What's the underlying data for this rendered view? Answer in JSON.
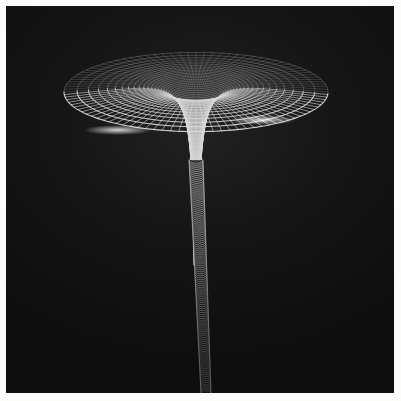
{
  "figure": {
    "title": "",
    "kind": "3d-wireframe-surface",
    "background_page": "#fbfbfa",
    "background_plot": "#0d0d0d",
    "margin_px": 6,
    "width_px": 401,
    "height_px": 401
  },
  "chart_data": {
    "type": "line",
    "title": "",
    "subtitle": "",
    "xlabel": "",
    "ylabel": "",
    "surface_kind": "polar wireframe funnel (gravity well)",
    "projection": "perspective",
    "grid": true,
    "legend": false,
    "line_color": "#d8d8d8",
    "fill_color": "#151515",
    "highlight_color": "#ffffff",
    "camera": {
      "elevation_deg": 14,
      "azimuth_deg": 0,
      "center_x_px": 196,
      "horizon_y_px": 28,
      "focal_scale": 1.0
    },
    "funnel": {
      "axis_x_px": 196,
      "mouth_top_y_px": 92,
      "throat_y_px": 160,
      "stem_bottom_y_px": 393,
      "mouth_radius_px": 132,
      "throat_radius_px": 7,
      "stem_radius_px": 5,
      "depth_profile": "z = -k / sqrt(r) (Flamm paraboloid)"
    },
    "mesh": {
      "radial_spokes": 96,
      "concentric_rings": 58,
      "ring_radii_min": 0.02,
      "ring_radii_max": 1.0,
      "ring_spacing": "geometric, densest near throat",
      "spoke_spacing": "uniform in azimuth"
    },
    "series": [
      {
        "name": "concentric rings",
        "count": 58,
        "color": "#d2d2d2"
      },
      {
        "name": "radial spokes",
        "count": 96,
        "color": "#c6c6c6"
      }
    ],
    "annotations": [
      {
        "label": "bright rim highlight left",
        "x_px": 118,
        "y_px": 130
      },
      {
        "label": "bright rim highlight right",
        "x_px": 262,
        "y_px": 120
      },
      {
        "label": "funnel throat",
        "x_px": 196,
        "y_px": 160
      }
    ],
    "xlim": [
      -1,
      1
    ],
    "ylim": [
      -1,
      1
    ]
  }
}
